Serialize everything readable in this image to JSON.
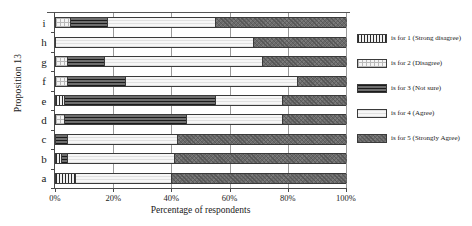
{
  "chart_data": {
    "type": "bar",
    "orientation": "horizontal",
    "stacked": true,
    "stack_mode": "percent",
    "title": "",
    "xlabel": "Percentage of respondents",
    "ylabel": "Proposition 13",
    "xlim": [
      0,
      100
    ],
    "xticks": [
      "0%",
      "20%",
      "40%",
      "60%",
      "80%",
      "100%"
    ],
    "xtick_values": [
      0,
      20,
      40,
      60,
      80,
      100
    ],
    "grid": "vertical",
    "legend_position": "right",
    "categories": [
      "a",
      "b",
      "c",
      "d",
      "e",
      "f",
      "g",
      "h",
      "i"
    ],
    "categories_top_to_bottom": [
      "i",
      "h",
      "g",
      "f",
      "e",
      "d",
      "c",
      "b",
      "a"
    ],
    "series": [
      {
        "name": "1 (Strong disagree)",
        "key": "1",
        "values": [
          7,
          0,
          0,
          0,
          3,
          0,
          0,
          0,
          0
        ]
      },
      {
        "name": "2 (Disagree)",
        "key": "2",
        "values": [
          0,
          2,
          0,
          3,
          0,
          4,
          4,
          0,
          5
        ]
      },
      {
        "name": "3 (Not sure)",
        "key": "3",
        "values": [
          0,
          2,
          4,
          42,
          52,
          20,
          13,
          0,
          13
        ]
      },
      {
        "name": "4 (Agree)",
        "key": "4",
        "values": [
          33,
          37,
          38,
          33,
          23,
          59,
          54,
          68,
          37
        ]
      },
      {
        "name": "5 (Strongly Agree)",
        "key": "5",
        "values": [
          60,
          59,
          58,
          22,
          22,
          17,
          29,
          32,
          45
        ]
      }
    ],
    "bars": [
      {
        "label": "i",
        "segments": [
          {
            "key": "2",
            "value": 5
          },
          {
            "key": "3",
            "value": 13
          },
          {
            "key": "4",
            "value": 37
          },
          {
            "key": "5",
            "value": 45
          }
        ]
      },
      {
        "label": "h",
        "segments": [
          {
            "key": "4",
            "value": 68
          },
          {
            "key": "5",
            "value": 32
          }
        ]
      },
      {
        "label": "g",
        "segments": [
          {
            "key": "2",
            "value": 4
          },
          {
            "key": "3",
            "value": 13
          },
          {
            "key": "4",
            "value": 54
          },
          {
            "key": "5",
            "value": 29
          }
        ]
      },
      {
        "label": "f",
        "segments": [
          {
            "key": "2",
            "value": 4
          },
          {
            "key": "3",
            "value": 20
          },
          {
            "key": "4",
            "value": 59
          },
          {
            "key": "5",
            "value": 17
          }
        ]
      },
      {
        "label": "e",
        "segments": [
          {
            "key": "1",
            "value": 3
          },
          {
            "key": "3",
            "value": 52
          },
          {
            "key": "4",
            "value": 23
          },
          {
            "key": "5",
            "value": 22
          }
        ]
      },
      {
        "label": "d",
        "segments": [
          {
            "key": "2",
            "value": 3
          },
          {
            "key": "3",
            "value": 42
          },
          {
            "key": "4",
            "value": 33
          },
          {
            "key": "5",
            "value": 22
          }
        ]
      },
      {
        "label": "c",
        "segments": [
          {
            "key": "3",
            "value": 4
          },
          {
            "key": "4",
            "value": 38
          },
          {
            "key": "5",
            "value": 58
          }
        ]
      },
      {
        "label": "b",
        "segments": [
          {
            "key": "1",
            "value": 2
          },
          {
            "key": "3",
            "value": 2
          },
          {
            "key": "4",
            "value": 37
          },
          {
            "key": "5",
            "value": 59
          }
        ]
      },
      {
        "label": "a",
        "segments": [
          {
            "key": "1",
            "value": 7
          },
          {
            "key": "4",
            "value": 33
          },
          {
            "key": "5",
            "value": 60
          }
        ]
      }
    ],
    "legend": [
      {
        "key": "1",
        "label": "is for 1 (Strong disagree)"
      },
      {
        "key": "2",
        "label": "is for 2 (Disagree)"
      },
      {
        "key": "3",
        "label": "is for 3 (Not sure)"
      },
      {
        "key": "4",
        "label": "is for 4 (Agree)"
      },
      {
        "key": "5",
        "label": "is for 5 (Strongly Agree)"
      }
    ]
  },
  "colors": {
    "axis": "#4a4a4a",
    "grid": "#9a9a9a",
    "bar_outline": "#3a3a3a",
    "fill_1": "#f2f2f2",
    "fill_2": "#f4f4f4",
    "fill_3": "#6e6e6e",
    "fill_4": "#ededed",
    "fill_5": "#6a6a6a",
    "background": "#ffffff"
  }
}
